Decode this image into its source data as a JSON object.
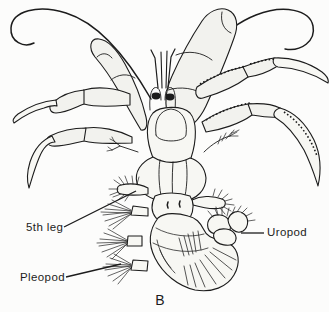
{
  "figure": {
    "caption": "B",
    "ink_color": "#1c1c1c",
    "background_color": "#fcfcfb"
  },
  "annotations": {
    "fifth_leg": "5th leg",
    "uropod": "Uropod",
    "pleopod": "Pleopod"
  }
}
